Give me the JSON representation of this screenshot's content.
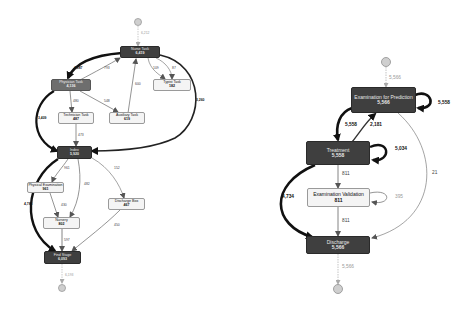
{
  "left_graph": {
    "start_count": "6,212",
    "end_count": "6,193",
    "nodes": {
      "nurse_task": {
        "label": "Nurse Task",
        "count": "6,419"
      },
      "physician_task": {
        "label": "Physician Task",
        "count": "4,136"
      },
      "technician_task": {
        "label": "Technician Task",
        "count": "487"
      },
      "auxiliary_task": {
        "label": "Auxiliary Task",
        "count": "619"
      },
      "typist_task": {
        "label": "Typist Task",
        "count": "182"
      },
      "index": {
        "label": "Index",
        "count": "5,920"
      },
      "physical_examination": {
        "label": "Physical Examination",
        "count": "961"
      },
      "nursery": {
        "label": "Nursery",
        "count": "802"
      },
      "discharge_box": {
        "label": "Discharge Box",
        "count": "467"
      },
      "find_stage": {
        "label": "Find Stage",
        "count": "6,093"
      }
    },
    "edges": {
      "nurse_to_physician": "4,087",
      "physician_to_nurse": "793",
      "nurse_to_typist_a": "109",
      "nurse_to_typist_b": "87",
      "auxiliary_to_nurse": "600",
      "nurse_to_index": "3,260",
      "physician_to_index": "3,409",
      "physician_to_technician": "480",
      "physician_to_auxiliary": "548",
      "technician_to_index": "473",
      "index_to_physical": "961",
      "index_to_nursery": "482",
      "index_to_discharge_box": "152",
      "index_to_find_stage": "4,786",
      "physical_to_nursery": "430",
      "nursery_to_find_stage": "597",
      "discharge_box_to_find_stage": "450"
    }
  },
  "right_graph": {
    "start_count": "5,566",
    "end_count": "5,566",
    "nodes": {
      "examination_for_prediction": {
        "label": "Examination for Prediction",
        "count": "5,566"
      },
      "treatment": {
        "label": "Treatment",
        "count": "5,558"
      },
      "examination_validation": {
        "label": "Examination Validation",
        "count": "811"
      },
      "discharge": {
        "label": "Discharge",
        "count": "5,566"
      }
    },
    "edges": {
      "prediction_self_loop": "5,558",
      "prediction_to_treatment": "5,558",
      "treatment_to_prediction": "2,181",
      "treatment_self_loop": "5,034",
      "treatment_to_validation": "811",
      "validation_self_loop": "395",
      "validation_to_discharge": "811",
      "treatment_to_discharge": "4,734",
      "prediction_to_discharge": "21"
    }
  },
  "colors": {
    "dark_node": "#3f3f3f",
    "mid_node": "#6e6e6e",
    "light_node": "#f4f4f4",
    "edge": "#555555",
    "heavy_edge": "#111111"
  }
}
